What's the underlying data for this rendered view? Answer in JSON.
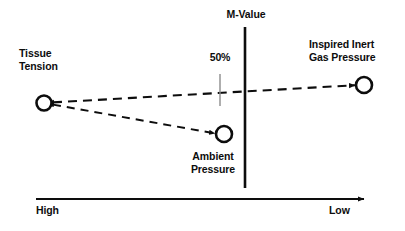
{
  "diagram": {
    "title_text": "M-Value",
    "nodes": [
      {
        "id": "tissue-tension",
        "label_line1": "Tissue",
        "label_line2": "Tension",
        "marker": "open-circle",
        "x": 44,
        "y": 103,
        "r": 7.5
      },
      {
        "id": "inspired-inert-gas-pressure",
        "label_line1": "Inspired Inert",
        "label_line2": "Gas Pressure",
        "marker": "open-circle",
        "x": 364,
        "y": 85,
        "r": 8
      },
      {
        "id": "ambient-pressure",
        "label_line1": "Ambient",
        "label_line2": "Pressure",
        "marker": "open-circle",
        "x": 224,
        "y": 134,
        "r": 8
      }
    ],
    "m_value_line": {
      "label": "M-Value",
      "x": 245,
      "y_top": 27,
      "y_bottom": 188
    },
    "midpoint_tick": {
      "label": "50%",
      "x": 220,
      "y_top": 74,
      "y_bottom": 106
    },
    "axis": {
      "left_label": "High",
      "right_label": "Low",
      "y": 199,
      "x_start": 36,
      "x_end": 370
    },
    "connectors": [
      {
        "id": "tissue-to-inspired",
        "from": "tissue-tension",
        "to": "inspired-inert-gas-pressure",
        "style": "dashed",
        "arrow": "both"
      },
      {
        "id": "tissue-to-ambient",
        "from": "tissue-tension",
        "to": "ambient-pressure",
        "style": "dashed",
        "arrow": "both"
      }
    ],
    "colors": {
      "ink": "#0d0d0d",
      "tick_gray": "#8c8c8c",
      "background": "#ffffff"
    }
  }
}
